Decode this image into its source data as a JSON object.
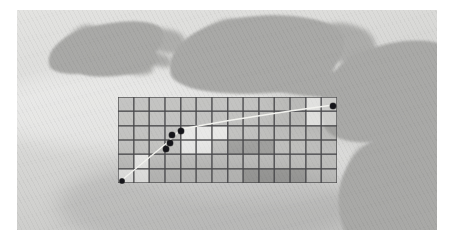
{
  "figure": {
    "kind": "map",
    "region_label": "",
    "caption": ""
  },
  "map": {
    "frame": {
      "x": 17,
      "y": 10,
      "width": 420,
      "height": 220
    },
    "palette": {
      "sea_light": "#e3e3e1",
      "sea_mid": "#d3d3d1",
      "sea_deep": "#c2c2c0",
      "land": "#a9a9a7",
      "land_shadow": "#9a9a98",
      "page_background": "#ffffff",
      "grid_line": "#46464a",
      "grid_fill": "rgba(120,120,120,0.42)",
      "track_line": "#f2f2ee",
      "marker": "#15151a"
    },
    "landmasses": [
      {
        "name": "ireland-northeast",
        "x": 30,
        "y": 14,
        "width": 118,
        "height": 48,
        "rotate": -12
      },
      {
        "name": "ireland-east-coast",
        "x": 62,
        "y": 40,
        "width": 78,
        "height": 26,
        "rotate": -8
      },
      {
        "name": "britain-wales-west",
        "x": 152,
        "y": 6,
        "width": 176,
        "height": 78,
        "rotate": -6
      },
      {
        "name": "britain-southwest-peninsula",
        "x": 236,
        "y": 60,
        "width": 112,
        "height": 26,
        "rotate": 4
      },
      {
        "name": "britain-channel-coast",
        "x": 300,
        "y": 34,
        "width": 150,
        "height": 96,
        "rotate": -18
      },
      {
        "name": "continent-southeast",
        "x": 318,
        "y": 120,
        "width": 150,
        "height": 130,
        "rotate": -26
      }
    ]
  },
  "grid_overlay": {
    "x": 118,
    "y": 97,
    "width": 219,
    "height": 86,
    "columns": 14,
    "rows": 6,
    "cell_width": 15.6,
    "cell_height": 14.3,
    "line_color": "#46464a",
    "line_width": 0.8,
    "shades": [
      [
        "mid",
        "mid",
        "mid",
        "mid",
        "mid",
        "mid",
        "mid",
        "mid",
        "mid",
        "mid",
        "mid",
        "mid",
        "light",
        "light"
      ],
      [
        "mid",
        "mid",
        "mid",
        "mid",
        "mid",
        "mid",
        "mid",
        "mid",
        "mid",
        "mid",
        "mid",
        "mid",
        "light",
        "light"
      ],
      [
        "mid",
        "mid",
        "mid",
        "mid",
        "light",
        "light",
        "light",
        "mid",
        "mid",
        "mid",
        "mid",
        "mid",
        "mid",
        "mid"
      ],
      [
        "mid",
        "mid",
        "mid",
        "mid",
        "light",
        "light",
        "mid",
        "dark",
        "dark",
        "dark",
        "mid",
        "mid",
        "mid",
        "mid"
      ],
      [
        "mid",
        "light",
        "mid",
        "mid",
        "mid",
        "mid",
        "mid",
        "mid",
        "mid",
        "mid",
        "mid",
        "mid",
        "mid",
        "mid"
      ],
      [
        "light",
        "light",
        "mid",
        "mid",
        "mid",
        "mid",
        "mid",
        "mid",
        "dark",
        "dark",
        "dark",
        "dark",
        "mid",
        "mid"
      ]
    ]
  },
  "track": {
    "name": "flight-track",
    "color": "#f2f2ee",
    "width": 1.4,
    "points": [
      {
        "x": 122,
        "y": 180
      },
      {
        "x": 168,
        "y": 142
      },
      {
        "x": 181,
        "y": 129
      },
      {
        "x": 232,
        "y": 120
      },
      {
        "x": 290,
        "y": 111
      },
      {
        "x": 333,
        "y": 105
      }
    ]
  },
  "markers": [
    {
      "name": "track-start-marker",
      "x": 122,
      "y": 181,
      "size": 5
    },
    {
      "name": "sample-marker-1",
      "x": 166,
      "y": 149,
      "size": 6
    },
    {
      "name": "sample-marker-2",
      "x": 170,
      "y": 143,
      "size": 6
    },
    {
      "name": "sample-marker-3",
      "x": 172,
      "y": 135,
      "size": 6
    },
    {
      "name": "sample-marker-4",
      "x": 181,
      "y": 131,
      "size": 6
    },
    {
      "name": "track-end-marker",
      "x": 333,
      "y": 106,
      "size": 6
    }
  ]
}
